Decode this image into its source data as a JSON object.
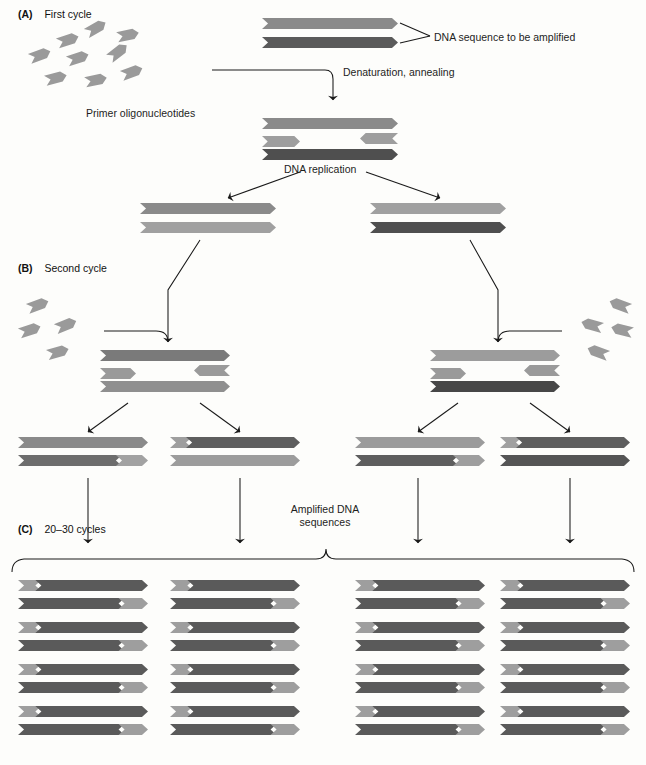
{
  "figure": {
    "kind": "pcr-amplification-diagram",
    "colors": {
      "light_gray": "#9e9e9e",
      "mid_gray": "#8a8a8a",
      "dark_gray": "#5e5e5e",
      "darkest_gray": "#4a4a4a",
      "primer_gray": "#9a9a9a",
      "line": "#1a1a1a",
      "background": "#fdfdfb"
    }
  },
  "sections": [
    {
      "tag": "(A)",
      "label": "First cycle"
    },
    {
      "tag": "(B)",
      "label": "Second cycle"
    },
    {
      "tag": "(C)",
      "label": "20–30 cycles"
    }
  ],
  "labels": {
    "dna_sequence_to_be_amplified": "DNA sequence to be amplified",
    "primer_oligonucleotides": "Primer oligonucleotides",
    "denaturation_annealing": "Denaturation, annealing",
    "dna_replication": "DNA replication",
    "amplified_dna_line1": "Amplified DNA",
    "amplified_dna_line2": "sequences"
  },
  "panel_a": {
    "template_duplex": {
      "top_strand_color": "#8a8a8a",
      "bottom_strand_color": "#5a5a5a"
    },
    "annealed_complex": {
      "top_template_color": "#8a8a8a",
      "bottom_template_color": "#4f4f4f",
      "primer_color": "#9e9e9e",
      "primer_count": 2
    },
    "products": [
      {
        "top_color": "#8a8a8a",
        "bottom_color": "#a0a0a0"
      },
      {
        "top_color": "#a0a0a0",
        "bottom_color": "#4f4f4f"
      }
    ],
    "primer_pool_count": 9
  },
  "panel_b": {
    "annealed_complexes": [
      {
        "top_template_color": "#7a7a7a",
        "bottom_template_color": "#8f8f8f"
      },
      {
        "top_template_color": "#9c9c9c",
        "bottom_template_color": "#474747"
      }
    ],
    "primer_pool_left_count": 4,
    "primer_pool_right_count": 4,
    "products": [
      {
        "top": [
          [
            "#8a8a8a",
            1.0
          ]
        ],
        "bottom": [
          [
            "#6d6d6d",
            0.8
          ],
          [
            "#a2a2a2",
            0.2
          ]
        ]
      },
      {
        "top": [
          [
            "#9e9e9e",
            0.17
          ],
          [
            "#5e5e5e",
            0.83
          ]
        ],
        "bottom": [
          [
            "#9c9c9c",
            1.0
          ]
        ]
      },
      {
        "top": [
          [
            "#9b9b9b",
            1.0
          ]
        ],
        "bottom": [
          [
            "#5e5e5e",
            0.8
          ],
          [
            "#9e9e9e",
            0.2
          ]
        ]
      },
      {
        "top": [
          [
            "#a0a0a0",
            0.17
          ],
          [
            "#5e5e5e",
            0.83
          ]
        ],
        "bottom": [
          [
            "#555555",
            1.0
          ]
        ]
      }
    ]
  },
  "panel_c": {
    "columns": 4,
    "rows": 4,
    "duplex": {
      "top": [
        [
          "#9e9e9e",
          0.18
        ],
        [
          "#5a5a5a",
          0.82
        ]
      ],
      "bottom": [
        [
          "#5a5a5a",
          0.82
        ],
        [
          "#9e9e9e",
          0.18
        ]
      ]
    },
    "total_duplexes": 16
  }
}
